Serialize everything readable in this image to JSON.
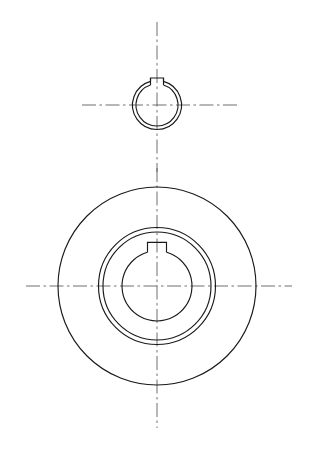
{
  "drawing": {
    "title": "Keyed Hub Orthographic Drawing",
    "sheet_size": {
      "width": 313,
      "height": 449
    },
    "background_color": "#ffffff",
    "line_color": "#1a1a1a",
    "centerline_color": "#555555",
    "views": [
      {
        "name": "detail-view-top",
        "label": "Keyway Bore Detail",
        "center": {
          "x": 157,
          "y": 105
        },
        "circles": [
          {
            "name": "detail-outer-circle",
            "radius": 24.5
          },
          {
            "name": "detail-bore-circle",
            "radius": 21.0
          }
        ],
        "keyway": {
          "name": "detail-keyway-notch",
          "half_width": 6.5,
          "height": 7.0,
          "position": "top"
        },
        "centerlines": {
          "vertical": {
            "x": 157,
            "y1": 22,
            "y2": 172
          },
          "horizontal": {
            "y": 105,
            "x1": 82,
            "x2": 238
          }
        }
      },
      {
        "name": "main-view-hub",
        "label": "Hub Front View",
        "center": {
          "x": 157,
          "y": 286
        },
        "circles": [
          {
            "name": "hub-outer-circle",
            "radius": 99.0
          },
          {
            "name": "boss-outer-circle",
            "radius": 58.5
          },
          {
            "name": "boss-inner-circle",
            "radius": 54.0
          },
          {
            "name": "bore-circle",
            "radius": 35.0
          }
        ],
        "keyway": {
          "name": "main-keyway-notch",
          "half_width": 9.5,
          "height": 10.0,
          "position": "top"
        },
        "centerlines": {
          "vertical": {
            "x": 157,
            "y1": 168,
            "y2": 428
          },
          "horizontal": {
            "y": 286,
            "x1": 26,
            "x2": 292
          }
        }
      }
    ]
  }
}
